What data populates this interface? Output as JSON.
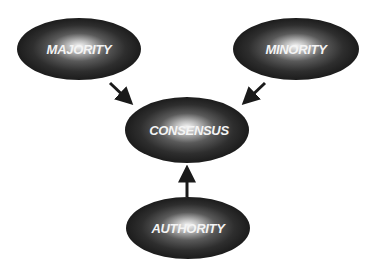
{
  "diagram": {
    "type": "influence-flow",
    "colors": {
      "background": "#ffffff",
      "node_dark": "#1e1e1e",
      "node_glow": "#f5f5f5",
      "label": "#f4f4f4",
      "arrow": "#1a1a1a"
    },
    "nodes": [
      {
        "id": "majority",
        "label": "MAJORITY",
        "cx": 79,
        "cy": 49,
        "rx": 62,
        "ry": 31
      },
      {
        "id": "minority",
        "label": "MINORITY",
        "cx": 296,
        "cy": 49,
        "rx": 63,
        "ry": 31
      },
      {
        "id": "consensus",
        "label": "CONSENSUS",
        "cx": 187,
        "cy": 130,
        "rx": 62,
        "ry": 33
      },
      {
        "id": "authority",
        "label": "AUTHORITY",
        "cx": 188,
        "cy": 228,
        "rx": 62,
        "ry": 31
      }
    ],
    "edges": [
      {
        "from": "majority",
        "to": "consensus"
      },
      {
        "from": "minority",
        "to": "consensus"
      },
      {
        "from": "authority",
        "to": "consensus"
      }
    ]
  }
}
